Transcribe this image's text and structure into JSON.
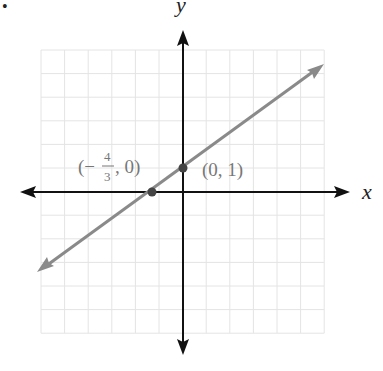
{
  "chart_data": {
    "type": "line",
    "title": "",
    "xlabel": "x",
    "ylabel": "y",
    "xlim": [
      -6,
      6
    ],
    "ylim": [
      -6,
      6
    ],
    "grid": true,
    "equation": "y = (3/4)x + 1",
    "series": [
      {
        "name": "line",
        "x": [
          -6,
          6
        ],
        "y": [
          -3.5,
          5.5
        ],
        "color": "#888888"
      }
    ],
    "points": [
      {
        "x": -1.3333,
        "y": 0,
        "label_parts": {
          "open": "(−",
          "num": "4",
          "den": "3",
          "close": ", 0)"
        }
      },
      {
        "x": 0,
        "y": 1,
        "label": "(0, 1)"
      }
    ]
  },
  "labels": {
    "x_axis": "x",
    "y_axis": "y",
    "point_a_open": "(−",
    "point_a_num": "4",
    "point_a_den": "3",
    "point_a_close": ", 0)",
    "point_b": "(0, 1)",
    "bullet": "•"
  },
  "colors": {
    "grid": "#e4e4e4",
    "axis": "#111111",
    "line": "#8a8a8a",
    "point": "#444444",
    "label": "#777777"
  }
}
